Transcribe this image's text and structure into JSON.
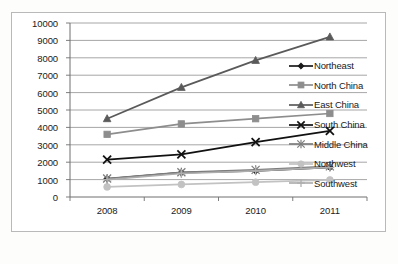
{
  "chart_data": {
    "type": "line",
    "title": "",
    "subtitle": "",
    "xlabel": "",
    "ylabel": "",
    "categories": [
      "2008",
      "2009",
      "2010",
      "2011"
    ],
    "x_tick_labels": [
      "2008",
      "2009",
      "2010",
      "2011"
    ],
    "y_tick_labels": [
      "0",
      "1000",
      "2000",
      "3000",
      "4000",
      "5000",
      "6000",
      "7000",
      "8000",
      "9000",
      "10000"
    ],
    "ylim": [
      0,
      10000
    ],
    "y_tick_step": 1000,
    "grid": "horizontal",
    "legend_position": "right",
    "series": [
      {
        "name": "Northeast",
        "marker": "diamond",
        "color": "#1a1a1a",
        "values": [
          1050,
          1400,
          1500,
          1700
        ]
      },
      {
        "name": "North China",
        "marker": "square",
        "color": "#8d8d8d",
        "values": [
          3600,
          4200,
          4500,
          4800
        ]
      },
      {
        "name": "East China",
        "marker": "triangle",
        "color": "#5a5a5a",
        "values": [
          4500,
          6300,
          7850,
          9200
        ]
      },
      {
        "name": "South China",
        "marker": "x",
        "color": "#111111",
        "values": [
          2150,
          2450,
          3150,
          3800
        ]
      },
      {
        "name": "Middle China",
        "marker": "asterisk",
        "color": "#7c7c7c",
        "values": [
          1060,
          1420,
          1560,
          1760
        ]
      },
      {
        "name": "Northwest",
        "marker": "circle",
        "color": "#c2c2c2",
        "values": [
          580,
          720,
          850,
          980
        ]
      },
      {
        "name": "Southwest",
        "marker": "plus",
        "color": "#aeaeae",
        "values": [
          1000,
          1350,
          1500,
          1700
        ]
      }
    ]
  },
  "legend": {
    "items": [
      {
        "label": "Northeast"
      },
      {
        "label": "North China"
      },
      {
        "label": "East China"
      },
      {
        "label": "South China"
      },
      {
        "label": "Middle China"
      },
      {
        "label": "Northwest"
      },
      {
        "label": "Southwest"
      }
    ]
  },
  "colors": {
    "frame": "#b9b9b9",
    "gridline": "#8f8f8f",
    "axis": "#6f6f6f",
    "background": "#ffffff",
    "text": "#1a1a1a"
  }
}
